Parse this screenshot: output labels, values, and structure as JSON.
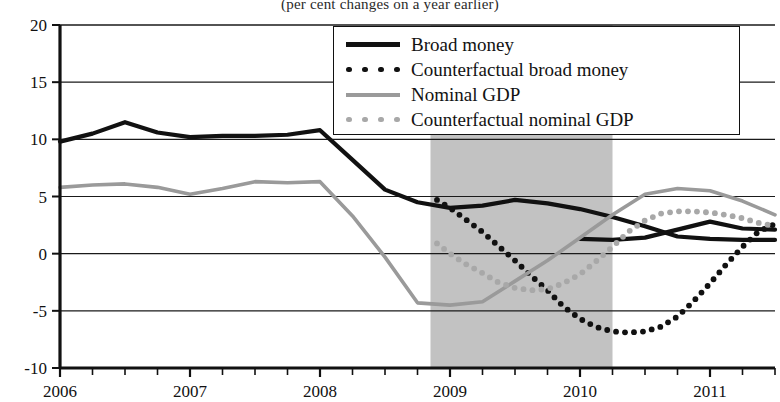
{
  "chart_data": {
    "type": "line",
    "title": "(per cent changes on a year earlier)",
    "xlabel": "",
    "ylabel": "",
    "ylim": [
      -10,
      20
    ],
    "xlim": [
      2006.0,
      2011.5
    ],
    "yticks": [
      "20",
      "15",
      "10",
      "5",
      "0",
      "-5",
      "-10"
    ],
    "ytick_values": [
      20,
      15,
      10,
      5,
      0,
      -5,
      -10
    ],
    "xticks": [
      "2006",
      "2007",
      "2008",
      "2009",
      "2010",
      "2011"
    ],
    "xtick_values": [
      2006,
      2007,
      2008,
      2009,
      2010,
      2011
    ],
    "grid": "horizontal",
    "legend_position": "top-right",
    "shaded_region": {
      "label": "recession",
      "x_start": 2008.85,
      "x_end": 2010.25,
      "color": "#c2c2c2"
    },
    "colors": {
      "broad_money": "#111111",
      "counterfactual_broad_money": "#111111",
      "nominal_gdp": "#9a9a9a",
      "counterfactual_nominal_gdp": "#a8a8a8",
      "shaded": "#c2c2c2",
      "axis": "#111111"
    },
    "series": [
      {
        "name": "Broad money",
        "style": "solid",
        "color": "#111111",
        "x": [
          2006.0,
          2006.25,
          2006.5,
          2006.75,
          2007.0,
          2007.25,
          2007.5,
          2007.75,
          2008.0,
          2008.25,
          2008.5,
          2008.75,
          2009.0,
          2009.25,
          2009.5,
          2009.75,
          2010.0,
          2010.25,
          2010.5,
          2010.75,
          2011.0,
          2011.25,
          2011.5
        ],
        "values": [
          9.8,
          10.5,
          11.5,
          10.6,
          10.2,
          10.3,
          10.3,
          10.4,
          10.8,
          8.2,
          5.6,
          4.5,
          4.0,
          4.2,
          4.7,
          4.4,
          3.9,
          3.2,
          2.4,
          1.5,
          1.3,
          1.2,
          1.2
        ]
      },
      {
        "name": "Broad money (cont)",
        "style": "solid",
        "color": "#111111",
        "x": [
          2010.0,
          2010.25,
          2010.5,
          2010.75,
          2011.0,
          2011.25,
          2011.5
        ],
        "values": [
          1.3,
          1.2,
          1.4,
          2.1,
          2.8,
          2.2,
          2.1
        ]
      },
      {
        "name": "Counterfactual broad money",
        "style": "dotted",
        "color": "#111111",
        "x": [
          2008.9,
          2009.0,
          2009.12,
          2009.25,
          2009.37,
          2009.5,
          2009.62,
          2009.75,
          2009.87,
          2010.0,
          2010.12,
          2010.25,
          2010.37,
          2010.5,
          2010.62,
          2010.75,
          2010.87,
          2011.0,
          2011.12,
          2011.25,
          2011.37,
          2011.5
        ],
        "values": [
          4.7,
          4.0,
          3.0,
          1.9,
          0.7,
          -0.6,
          -1.9,
          -3.2,
          -4.6,
          -5.7,
          -6.4,
          -6.8,
          -6.9,
          -6.8,
          -6.4,
          -5.5,
          -4.2,
          -2.6,
          -1.0,
          0.6,
          1.9,
          2.6
        ]
      },
      {
        "name": "Nominal GDP",
        "style": "solid",
        "color": "#9a9a9a",
        "x": [
          2006.0,
          2006.25,
          2006.5,
          2006.75,
          2007.0,
          2007.25,
          2007.5,
          2007.75,
          2008.0,
          2008.25,
          2008.5,
          2008.75,
          2009.0,
          2009.25,
          2009.5,
          2009.75,
          2010.0,
          2010.25,
          2010.5,
          2010.75,
          2011.0,
          2011.25,
          2011.5
        ],
        "values": [
          5.8,
          6.0,
          6.1,
          5.8,
          5.2,
          5.7,
          6.3,
          6.2,
          6.3,
          3.3,
          -0.3,
          -4.3,
          -4.5,
          -4.2,
          -2.4,
          -0.6,
          1.4,
          3.4,
          5.2,
          5.7,
          5.5,
          4.6,
          3.4
        ]
      },
      {
        "name": "Counterfactual nominal GDP",
        "style": "dotted",
        "color": "#a8a8a8",
        "x": [
          2008.9,
          2009.0,
          2009.12,
          2009.25,
          2009.37,
          2009.5,
          2009.62,
          2009.75,
          2009.87,
          2010.0,
          2010.12,
          2010.25,
          2010.37,
          2010.5,
          2010.62,
          2010.75,
          2010.87,
          2011.0,
          2011.12,
          2011.25,
          2011.37,
          2011.5
        ],
        "values": [
          0.9,
          0.0,
          -0.9,
          -1.7,
          -2.5,
          -3.0,
          -3.2,
          -3.1,
          -2.6,
          -1.8,
          -0.7,
          0.6,
          1.9,
          2.9,
          3.5,
          3.7,
          3.7,
          3.6,
          3.4,
          3.1,
          2.7,
          2.4
        ]
      }
    ]
  },
  "legend": {
    "items": [
      {
        "label": "Broad money",
        "style": "solid-dark"
      },
      {
        "label": "Counterfactual broad money",
        "style": "dot-dark"
      },
      {
        "label": "Nominal GDP",
        "style": "solid-grey"
      },
      {
        "label": "Counterfactual nominal GDP",
        "style": "dot-grey"
      }
    ]
  }
}
